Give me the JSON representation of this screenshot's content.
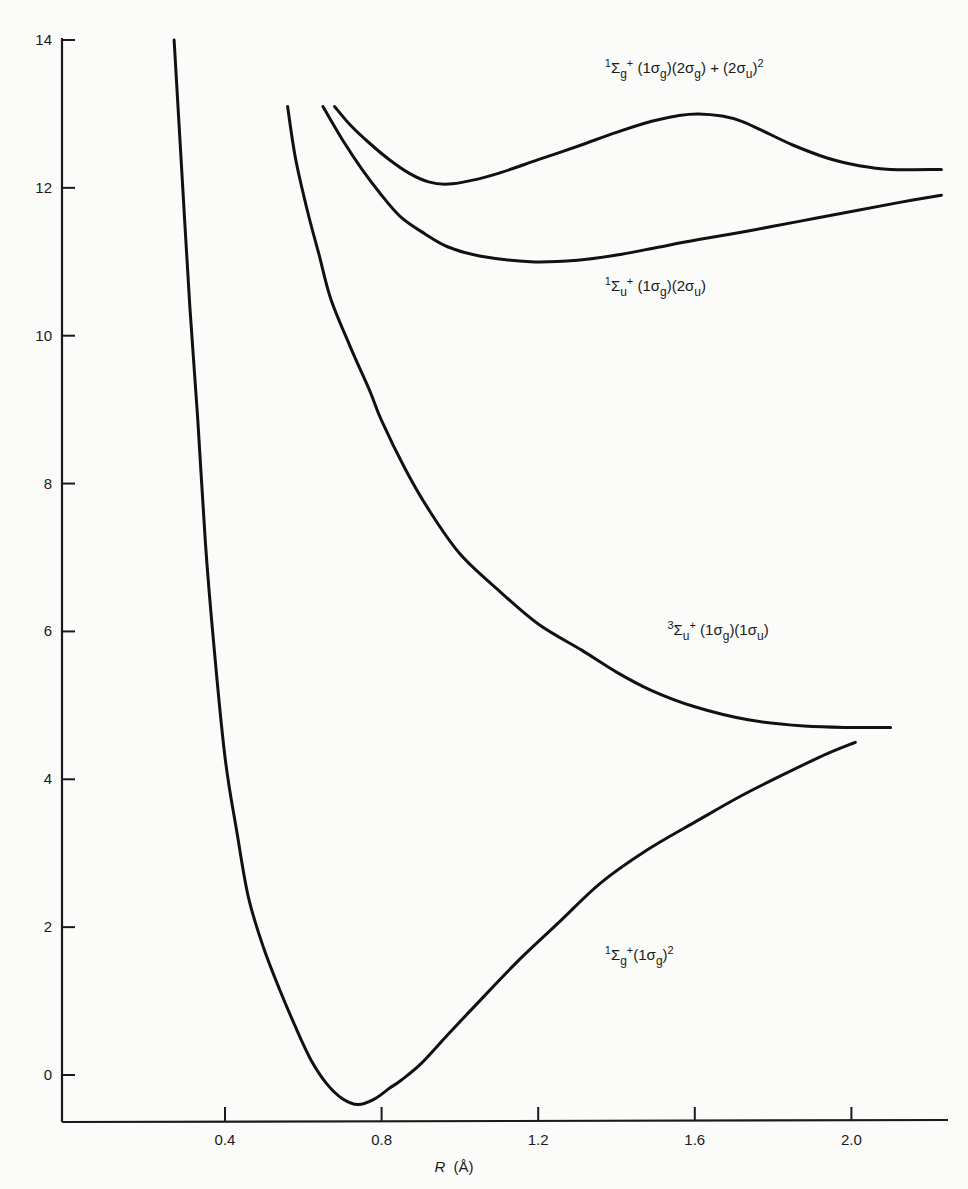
{
  "chart_data": {
    "type": "line",
    "title": "",
    "xlabel": "R (Å)",
    "xlabel_italic_part": "R",
    "xlabel_unit": "(Å)",
    "ylabel": "",
    "xlim": [
      0.0,
      2.24
    ],
    "ylim": [
      -0.62,
      14.0
    ],
    "xticks": [
      0.4,
      0.8,
      1.2,
      1.6,
      2.0
    ],
    "xtick_labels": [
      "0.4",
      "0.8",
      "1.2",
      "1.6",
      "2.0"
    ],
    "yticks": [
      0,
      2,
      4,
      6,
      8,
      10,
      12,
      14
    ],
    "ytick_labels": [
      "0",
      "2",
      "4",
      "6",
      "8",
      "10",
      "12",
      "14"
    ],
    "grid": false,
    "legend": "none (inline curve labels)",
    "series": [
      {
        "name": "1Σg+ (1σg)(2σg) + (2σu)2",
        "label_parts": [
          [
            "sup",
            "1"
          ],
          [
            "t",
            "Σ"
          ],
          [
            "sub",
            "g"
          ],
          [
            "sup",
            "+"
          ],
          [
            "t",
            " (1σ"
          ],
          [
            "sub",
            "g"
          ],
          [
            "t",
            ")(2σ"
          ],
          [
            "sub",
            "g"
          ],
          [
            "t",
            ") + (2σ"
          ],
          [
            "sub",
            "u"
          ],
          [
            "t",
            ")"
          ],
          [
            "sup",
            "2"
          ]
        ],
        "label_anchor": [
          1.37,
          13.55
        ],
        "x": [
          0.68,
          0.72,
          0.77,
          0.82,
          0.87,
          0.92,
          0.97,
          1.03,
          1.1,
          1.2,
          1.31,
          1.4,
          1.49,
          1.56,
          1.61,
          1.67,
          1.72,
          1.77,
          1.85,
          1.94,
          2.02,
          2.1,
          2.23
        ],
        "y": [
          13.1,
          12.85,
          12.6,
          12.38,
          12.2,
          12.08,
          12.05,
          12.1,
          12.2,
          12.38,
          12.58,
          12.75,
          12.9,
          12.98,
          13.0,
          12.97,
          12.9,
          12.78,
          12.58,
          12.4,
          12.3,
          12.25,
          12.25
        ]
      },
      {
        "name": "1Σu+ (1σg)(2σu)",
        "label_parts": [
          [
            "sup",
            "1"
          ],
          [
            "t",
            "Σ"
          ],
          [
            "sub",
            "u"
          ],
          [
            "sup",
            "+"
          ],
          [
            "t",
            " (1σ"
          ],
          [
            "sub",
            "g"
          ],
          [
            "t",
            ")(2σ"
          ],
          [
            "sub",
            "u"
          ],
          [
            "t",
            ")"
          ]
        ],
        "label_anchor": [
          1.37,
          10.6
        ],
        "x": [
          0.65,
          0.7,
          0.75,
          0.8,
          0.85,
          0.91,
          0.97,
          1.05,
          1.18,
          1.3,
          1.41,
          1.51,
          1.61,
          1.74,
          1.87,
          2.0,
          2.12,
          2.23
        ],
        "y": [
          13.1,
          12.65,
          12.25,
          11.9,
          11.6,
          11.38,
          11.2,
          11.08,
          11.0,
          11.02,
          11.1,
          11.2,
          11.3,
          11.42,
          11.55,
          11.68,
          11.8,
          11.9
        ]
      },
      {
        "name": "3Σu+ (1σg)(1σu)",
        "label_parts": [
          [
            "sup",
            "3"
          ],
          [
            "t",
            "Σ"
          ],
          [
            "sub",
            "u"
          ],
          [
            "sup",
            "+"
          ],
          [
            "t",
            " (1σ"
          ],
          [
            "sub",
            "g"
          ],
          [
            "t",
            ")(1σ"
          ],
          [
            "sub",
            "u"
          ],
          [
            "t",
            ")"
          ]
        ],
        "label_anchor": [
          1.53,
          5.95
        ],
        "x": [
          0.56,
          0.58,
          0.61,
          0.64,
          0.67,
          0.72,
          0.77,
          0.8,
          0.86,
          0.92,
          1.0,
          1.1,
          1.2,
          1.31,
          1.4,
          1.49,
          1.6,
          1.74,
          1.88,
          2.0,
          2.1
        ],
        "y": [
          13.1,
          12.4,
          11.7,
          11.1,
          10.5,
          9.85,
          9.25,
          8.85,
          8.2,
          7.65,
          7.05,
          6.55,
          6.1,
          5.75,
          5.45,
          5.2,
          4.98,
          4.8,
          4.72,
          4.7,
          4.7
        ]
      },
      {
        "name": "1Σg+ (1σg)2",
        "label_parts": [
          [
            "sup",
            "1"
          ],
          [
            "t",
            "Σ"
          ],
          [
            "sub",
            "g"
          ],
          [
            "sup",
            "+"
          ],
          [
            "t",
            "(1σ"
          ],
          [
            "sub",
            "g"
          ],
          [
            "t",
            ")"
          ],
          [
            "sup",
            "2"
          ]
        ],
        "label_anchor": [
          1.37,
          1.55
        ],
        "x": [
          0.27,
          0.29,
          0.31,
          0.33,
          0.35,
          0.37,
          0.4,
          0.43,
          0.46,
          0.5,
          0.54,
          0.58,
          0.62,
          0.66,
          0.7,
          0.74,
          0.78,
          0.82,
          0.85,
          0.9,
          0.97,
          1.05,
          1.15,
          1.25,
          1.36,
          1.48,
          1.61,
          1.72,
          1.84,
          1.94,
          2.01
        ],
        "y": [
          14.0,
          12.2,
          10.4,
          8.9,
          7.2,
          5.9,
          4.3,
          3.3,
          2.4,
          1.7,
          1.15,
          0.65,
          0.2,
          -0.12,
          -0.32,
          -0.4,
          -0.33,
          -0.18,
          -0.07,
          0.15,
          0.55,
          1.0,
          1.55,
          2.05,
          2.6,
          3.05,
          3.45,
          3.78,
          4.1,
          4.35,
          4.5
        ]
      }
    ]
  }
}
